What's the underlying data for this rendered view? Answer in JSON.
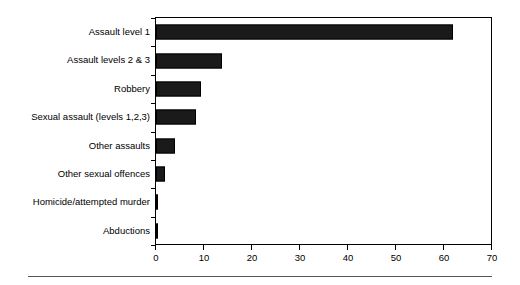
{
  "chart_data": {
    "type": "bar",
    "orientation": "horizontal",
    "title": "",
    "subtitle": "",
    "xlabel": "",
    "ylabel": "",
    "xlim": [
      0,
      70
    ],
    "ylim": null,
    "grid": false,
    "legend": null,
    "xticks": [
      "0",
      "10",
      "20",
      "30",
      "40",
      "50",
      "60",
      "70"
    ],
    "xtick_values": [
      0,
      10,
      20,
      30,
      40,
      50,
      60,
      70
    ],
    "categories": [
      "Assault level 1",
      "Assault levels 2 & 3",
      "Robbery",
      "Sexual assault (levels 1,2,3)",
      "Other assaults",
      "Other sexual offences",
      "Homicide/attempted murder",
      "Abductions"
    ],
    "values": [
      61.8,
      13.7,
      9.4,
      8.3,
      4.0,
      1.9,
      0.5,
      0.5
    ],
    "bar_color": "#1a1a1a",
    "annotations": []
  }
}
